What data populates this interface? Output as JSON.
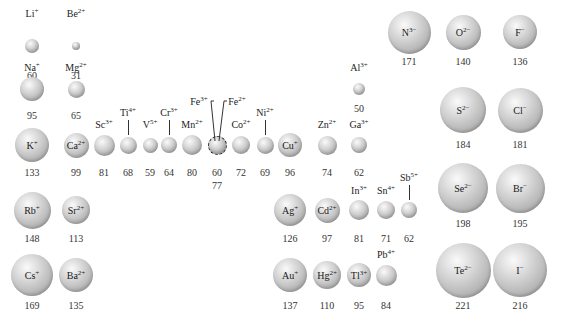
{
  "units": "pm",
  "ions": [
    {
      "id": "li",
      "symbol": "Li",
      "charge": "+",
      "radius": "60"
    },
    {
      "id": "be",
      "symbol": "Be",
      "charge": "2+",
      "radius": "31"
    },
    {
      "id": "na",
      "symbol": "Na",
      "charge": "+",
      "radius": "95"
    },
    {
      "id": "mg",
      "symbol": "Mg",
      "charge": "2+",
      "radius": "65"
    },
    {
      "id": "k",
      "symbol": "K",
      "charge": "+",
      "radius": "133"
    },
    {
      "id": "ca",
      "symbol": "Ca",
      "charge": "2+",
      "radius": "99"
    },
    {
      "id": "sc",
      "symbol": "Sc",
      "charge": "3+",
      "radius": "81"
    },
    {
      "id": "ti",
      "symbol": "Ti",
      "charge": "4+",
      "radius": "68"
    },
    {
      "id": "v",
      "symbol": "V",
      "charge": "5+",
      "radius": "59"
    },
    {
      "id": "cr",
      "symbol": "Cr",
      "charge": "3+",
      "radius": "64"
    },
    {
      "id": "mn",
      "symbol": "Mn",
      "charge": "2+",
      "radius": "80"
    },
    {
      "id": "fe3",
      "symbol": "Fe",
      "charge": "3+",
      "radius": "60"
    },
    {
      "id": "fe2",
      "symbol": "Fe",
      "charge": "2+",
      "radius": "77"
    },
    {
      "id": "co",
      "symbol": "Co",
      "charge": "2+",
      "radius": "72"
    },
    {
      "id": "ni",
      "symbol": "Ni",
      "charge": "2+",
      "radius": "69"
    },
    {
      "id": "cu",
      "symbol": "Cu",
      "charge": "+",
      "radius": "96"
    },
    {
      "id": "zn",
      "symbol": "Zn",
      "charge": "2+",
      "radius": "74"
    },
    {
      "id": "al",
      "symbol": "Al",
      "charge": "3+",
      "radius": "50"
    },
    {
      "id": "ga",
      "symbol": "Ga",
      "charge": "3+",
      "radius": "62"
    },
    {
      "id": "rb",
      "symbol": "Rb",
      "charge": "+",
      "radius": "148"
    },
    {
      "id": "sr",
      "symbol": "Sr",
      "charge": "2+",
      "radius": "113"
    },
    {
      "id": "ag",
      "symbol": "Ag",
      "charge": "+",
      "radius": "126"
    },
    {
      "id": "cd",
      "symbol": "Cd",
      "charge": "2+",
      "radius": "97"
    },
    {
      "id": "in",
      "symbol": "In",
      "charge": "3+",
      "radius": "81"
    },
    {
      "id": "sn",
      "symbol": "Sn",
      "charge": "4+",
      "radius": "71"
    },
    {
      "id": "sb",
      "symbol": "Sb",
      "charge": "5+",
      "radius": "62"
    },
    {
      "id": "cs",
      "symbol": "Cs",
      "charge": "+",
      "radius": "169"
    },
    {
      "id": "ba",
      "symbol": "Ba",
      "charge": "2+",
      "radius": "135"
    },
    {
      "id": "au",
      "symbol": "Au",
      "charge": "+",
      "radius": "137"
    },
    {
      "id": "hg",
      "symbol": "Hg",
      "charge": "2+",
      "radius": "110"
    },
    {
      "id": "tl",
      "symbol": "Tl",
      "charge": "3+",
      "radius": "95"
    },
    {
      "id": "pb",
      "symbol": "Pb",
      "charge": "4+",
      "radius": "84"
    },
    {
      "id": "n",
      "symbol": "N",
      "charge": "3−",
      "radius": "171"
    },
    {
      "id": "o",
      "symbol": "O",
      "charge": "2−",
      "radius": "140"
    },
    {
      "id": "f",
      "symbol": "F",
      "charge": "−",
      "radius": "136"
    },
    {
      "id": "s",
      "symbol": "S",
      "charge": "2−",
      "radius": "184"
    },
    {
      "id": "cl",
      "symbol": "Cl",
      "charge": "−",
      "radius": "181"
    },
    {
      "id": "se",
      "symbol": "Se",
      "charge": "2−",
      "radius": "198"
    },
    {
      "id": "br",
      "symbol": "Br",
      "charge": "−",
      "radius": "195"
    },
    {
      "id": "te",
      "symbol": "Te",
      "charge": "2−",
      "radius": "221"
    },
    {
      "id": "i",
      "symbol": "I",
      "charge": "−",
      "radius": "216"
    }
  ]
}
